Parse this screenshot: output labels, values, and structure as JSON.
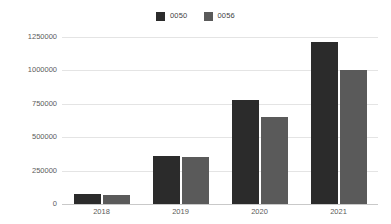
{
  "chart_data": {
    "type": "bar",
    "title": "",
    "subtitle": "",
    "xlabel": "",
    "ylabel": "",
    "categories": [
      "2018",
      "2019",
      "2020",
      "2021"
    ],
    "series": [
      {
        "name": "0050",
        "color": "#2b2b2b",
        "values": [
          75000,
          360000,
          780000,
          1210000
        ]
      },
      {
        "name": "0056",
        "color": "#5a5a5a",
        "values": [
          70000,
          355000,
          650000,
          1000000
        ]
      }
    ],
    "ylim": [
      0,
      1250000
    ],
    "yticks": [
      0,
      250000,
      500000,
      750000,
      1000000,
      1250000
    ],
    "ytick_labels": [
      "0",
      "250000",
      "500000",
      "750000",
      "1000000",
      "1250000"
    ],
    "grid": true,
    "grid_axis": "y",
    "grid_color": "#e4e4e4",
    "legend": {
      "position": "top-center",
      "entries": [
        {
          "label": "0050",
          "color": "#2b2b2b"
        },
        {
          "label": "0056",
          "color": "#5a5a5a"
        }
      ]
    },
    "background": "#ffffff",
    "axis_color": "#c9c9c9"
  }
}
